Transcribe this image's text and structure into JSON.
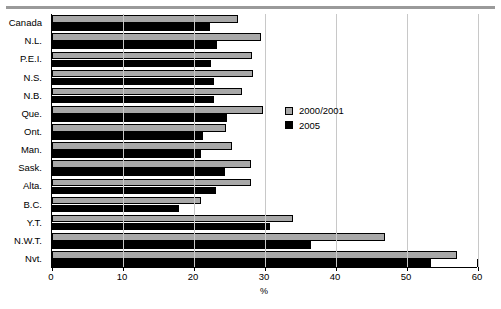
{
  "chart_data": {
    "type": "bar",
    "orientation": "horizontal",
    "title": "",
    "xlabel": "%",
    "ylabel": "",
    "xlim": [
      0,
      60
    ],
    "xticks": [
      0,
      10,
      20,
      30,
      40,
      50,
      60
    ],
    "xtick_labels": [
      "0",
      "10",
      "20",
      "30",
      "40",
      "50",
      "60"
    ],
    "grid": true,
    "grid_axis": "x",
    "legend_position": "center-right",
    "categories": [
      "Canada",
      "N.L.",
      "P.E.I.",
      "N.S.",
      "N.B.",
      "Que.",
      "Ont.",
      "Man.",
      "Sask.",
      "Alta.",
      "B.C.",
      "Y.T.",
      "N.W.T.",
      "Nvt."
    ],
    "series": [
      {
        "name": "2000/2001",
        "color": "#a8a8a8",
        "values": [
          26.2,
          29.4,
          28.2,
          28.3,
          26.8,
          29.7,
          24.5,
          25.4,
          28.0,
          28.0,
          21.0,
          34.0,
          46.9,
          57.0
        ]
      },
      {
        "name": "2005",
        "color": "#000000",
        "values": [
          22.3,
          23.2,
          22.4,
          22.8,
          22.8,
          24.6,
          21.3,
          21.0,
          24.4,
          23.1,
          17.9,
          30.7,
          36.5,
          53.4
        ]
      }
    ]
  },
  "legend": {
    "items": [
      {
        "label": "2000/2001",
        "color": "#a8a8a8"
      },
      {
        "label": "2005",
        "color": "#000000"
      }
    ]
  },
  "axis": {
    "x_title": "%"
  }
}
